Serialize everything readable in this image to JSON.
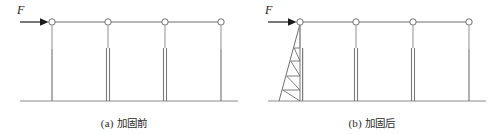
{
  "figure": {
    "panels": [
      {
        "id": "panel-a",
        "tag": "(a)",
        "caption": "加固前",
        "force_label": "F",
        "origin_x": 0,
        "beam_y": 22,
        "ground_y": 101,
        "ground_x1": 20,
        "ground_x2": 238,
        "beam_x1": 52,
        "beam_x2": 221,
        "joints_x": [
          52,
          108,
          165,
          221
        ],
        "columns": [
          {
            "x": 52,
            "type": "single",
            "split_y": 49
          },
          {
            "x": 108,
            "type": "double",
            "split_y": 48,
            "gap": 3
          },
          {
            "x": 165,
            "type": "double",
            "split_y": 48,
            "gap": 3
          },
          {
            "x": 221,
            "type": "single",
            "split_y": 49
          }
        ],
        "arrow": {
          "x1": 20,
          "x2": 47,
          "y": 22
        },
        "label_pos": {
          "x": 17,
          "y": 14
        },
        "truss": null
      },
      {
        "id": "panel-b",
        "tag": "(b)",
        "caption": "加固后",
        "force_label": "F",
        "origin_x": 248,
        "beam_y": 22,
        "ground_y": 101,
        "ground_x1": 268,
        "ground_x2": 486,
        "beam_x1": 300,
        "beam_x2": 469,
        "joints_x": [
          300,
          356,
          413,
          469
        ],
        "columns": [
          {
            "x": 300,
            "type": "single",
            "split_y": 49
          },
          {
            "x": 356,
            "type": "double",
            "split_y": 48,
            "gap": 3
          },
          {
            "x": 413,
            "type": "double",
            "split_y": 48,
            "gap": 3
          },
          {
            "x": 469,
            "type": "single",
            "split_y": 49
          }
        ],
        "arrow": {
          "x1": 268,
          "x2": 295,
          "y": 22
        },
        "label_pos": {
          "x": 265,
          "y": 14
        },
        "truss": {
          "apex_x": 300,
          "apex_y": 24,
          "base_x": 279,
          "base_y": 101,
          "chord_x": 300,
          "struts_y": [
            48,
            61,
            76,
            90
          ],
          "note": "triangular outrigger brace with zigzag web"
        }
      }
    ],
    "colors": {
      "line": "#6e6e6e",
      "line_dark": "#4a4a4a",
      "text": "#2b2b2b",
      "background": "#ffffff",
      "joint_fill": "#ffffff"
    }
  }
}
